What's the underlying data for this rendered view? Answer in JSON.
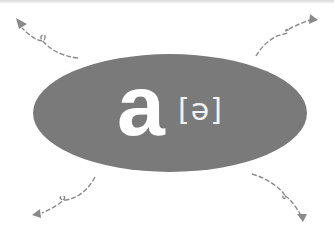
{
  "card": {
    "letter": "a",
    "ipa": "[ə]",
    "ellipse_color": "#7a7a7a",
    "text_color": "#ffffff",
    "arrow_color": "#8a8a8a"
  },
  "arrows": [
    {
      "id": "top-left",
      "direction": "up-left"
    },
    {
      "id": "top-right",
      "direction": "up-right"
    },
    {
      "id": "bottom-left",
      "direction": "down-left"
    },
    {
      "id": "bottom-right",
      "direction": "down-right"
    }
  ]
}
